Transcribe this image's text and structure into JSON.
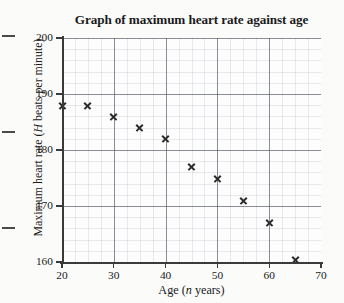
{
  "chart_data": {
    "type": "scatter",
    "title": "Graph of maximum heart rate against age",
    "xlabel": "Age (n years)",
    "xlabel_parts": {
      "pre": "Age (",
      "italic": "n",
      "post": " years)"
    },
    "ylabel": "Maximum heart rate (H beats per minute)",
    "ylabel_parts": {
      "pre": "Maximum heart rate (",
      "italic": "H",
      "post": " beats per minute)"
    },
    "xlim": [
      20,
      70
    ],
    "ylim": [
      160,
      200
    ],
    "xticks": [
      20,
      30,
      40,
      50,
      60,
      70
    ],
    "yticks": [
      160,
      170,
      180,
      190,
      200
    ],
    "x_minor_step": 2,
    "y_minor_step": 2,
    "grid": true,
    "legend": false,
    "marker": "x",
    "marker_color": "#2b2b2b",
    "x": [
      20,
      25,
      30,
      35,
      40,
      45,
      50,
      55,
      60,
      65
    ],
    "y": [
      188,
      188,
      186,
      184,
      182,
      177,
      175,
      171,
      167,
      160.5
    ],
    "points": [
      {
        "x": 20,
        "y": 188
      },
      {
        "x": 25,
        "y": 188
      },
      {
        "x": 30,
        "y": 186
      },
      {
        "x": 35,
        "y": 184
      },
      {
        "x": 40,
        "y": 182
      },
      {
        "x": 45,
        "y": 177
      },
      {
        "x": 50,
        "y": 175
      },
      {
        "x": 55,
        "y": 171
      },
      {
        "x": 60,
        "y": 167
      },
      {
        "x": 65,
        "y": 160.5
      }
    ]
  }
}
